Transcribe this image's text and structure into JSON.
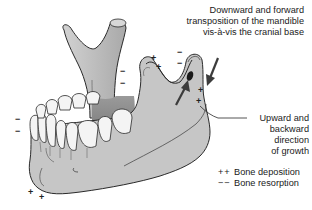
{
  "figure": {
    "labels": {
      "displacement": [
        "Downward and forward",
        "transposition of the mandible",
        "vis-à-vis the cranial base"
      ],
      "growth": [
        "Upward and",
        "backward direction",
        "of growth"
      ]
    },
    "legend": [
      {
        "symbol": "++",
        "text": "Bone deposition"
      },
      {
        "symbol": "−−",
        "text": "Bone resorption"
      }
    ],
    "marks": [
      {
        "sign": "−",
        "x": 123,
        "y": 72
      },
      {
        "sign": "−",
        "x": 123,
        "y": 84
      },
      {
        "sign": "+",
        "x": 154,
        "y": 59
      },
      {
        "sign": "+",
        "x": 159,
        "y": 68
      },
      {
        "sign": "−",
        "x": 180,
        "y": 53
      },
      {
        "sign": "−",
        "x": 180,
        "y": 64
      },
      {
        "sign": "+",
        "x": 201,
        "y": 91
      },
      {
        "sign": "+",
        "x": 199,
        "y": 102
      },
      {
        "sign": "−",
        "x": 18,
        "y": 120
      },
      {
        "sign": "−",
        "x": 18,
        "y": 132
      },
      {
        "sign": "+",
        "x": 31,
        "y": 193
      },
      {
        "sign": "+",
        "x": 42,
        "y": 198
      }
    ],
    "colors": {
      "bone_fill": "#c8c8c8",
      "bone_shadow": "#8f8f8f",
      "outline": "#2a2a2a",
      "arrow": "#3c3c3c",
      "tooth_fill": "#f4f4f4"
    }
  }
}
